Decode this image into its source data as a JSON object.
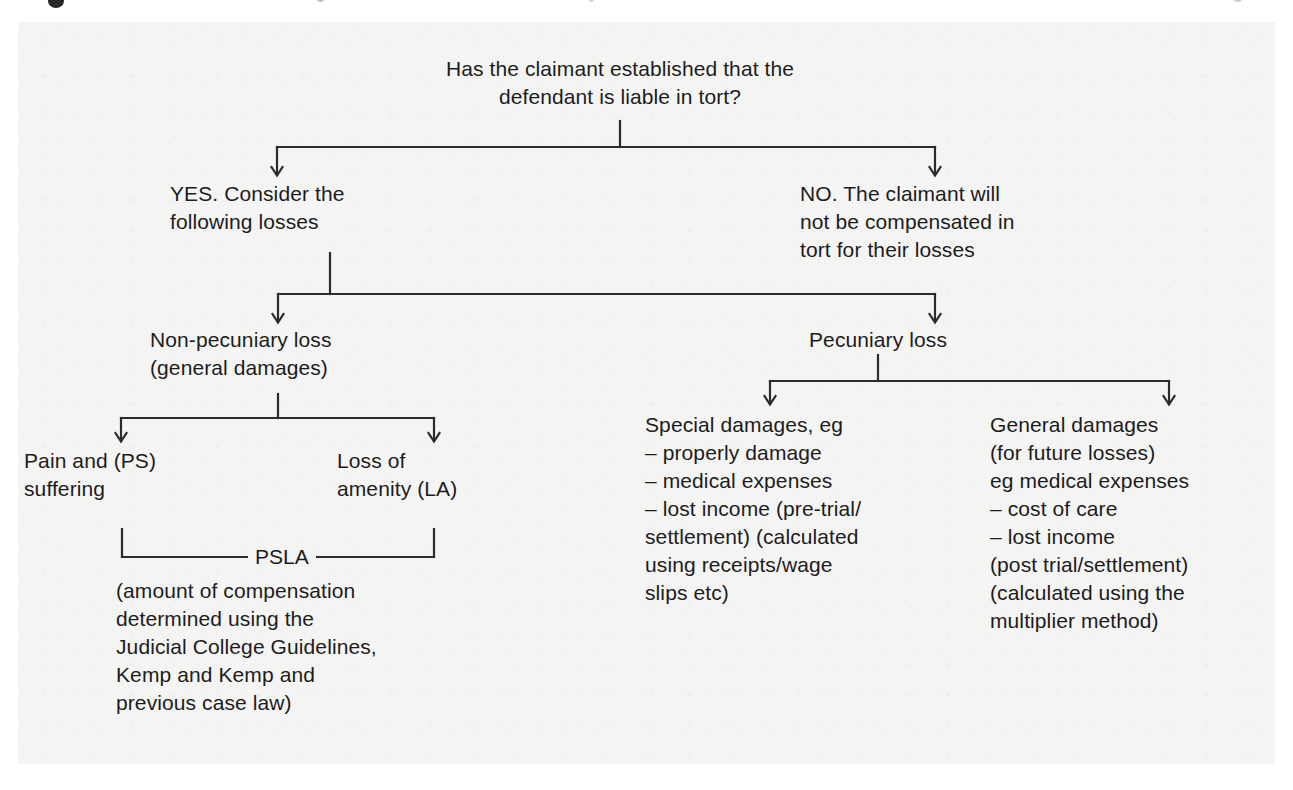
{
  "diagram": {
    "type": "flowchart",
    "title_visible": false,
    "background_color": "#f4f4f3",
    "line_color": "#2b2b2b",
    "text_color": "#1c1c1c",
    "nodes": {
      "root": {
        "id": "root",
        "label": "Has the claimant established that the\ndefendant is liable in tort?",
        "align": "center"
      },
      "yes": {
        "id": "yes",
        "label": "YES. Consider the\nfollowing losses",
        "align": "left"
      },
      "no": {
        "id": "no",
        "label": "NO. The claimant will\nnot be compensated in\ntort for their losses",
        "align": "left"
      },
      "non_pecuniary": {
        "id": "non-pecuniary-loss",
        "label": "Non-pecuniary loss\n(general damages)",
        "align": "left"
      },
      "pecuniary": {
        "id": "pecuniary-loss",
        "label": "Pecuniary loss",
        "align": "center"
      },
      "pain_suffering": {
        "id": "pain-and-suffering",
        "label": "Pain and (PS)\nsuffering",
        "align": "left"
      },
      "loss_amenity": {
        "id": "loss-of-amenity",
        "label": "Loss of\namenity (LA)",
        "align": "left"
      },
      "psla_label": {
        "id": "psla",
        "label": "PSLA"
      },
      "psla_note": {
        "id": "psla-note",
        "label": "(amount of compensation\ndetermined using the\nJudicial College Guidelines,\nKemp and Kemp and\nprevious case law)",
        "align": "left"
      },
      "special_damages": {
        "id": "special-damages",
        "label": "Special damages, eg\n–  properly damage\n–  medical expenses\n–  lost income (pre-trial/\n    settlement) (calculated\n    using receipts/wage\n    slips etc)",
        "align": "left"
      },
      "general_damages": {
        "id": "general-damages",
        "label": "General damages\n(for future losses)\neg medical expenses\n– cost of care\n– lost income\n(post trial/settlement)\n(calculated using the\nmultiplier method)",
        "align": "left"
      }
    },
    "edges": [
      {
        "from": "root",
        "to": "yes",
        "style": "elbow-split",
        "arrow": true
      },
      {
        "from": "root",
        "to": "no",
        "style": "elbow-split",
        "arrow": true
      },
      {
        "from": "yes",
        "to": "non_pecuniary",
        "style": "elbow-split",
        "arrow": true
      },
      {
        "from": "yes",
        "to": "pecuniary",
        "style": "elbow-split",
        "arrow": true
      },
      {
        "from": "non_pecuniary",
        "to": "pain_suffering",
        "style": "elbow-split",
        "arrow": true
      },
      {
        "from": "non_pecuniary",
        "to": "loss_amenity",
        "style": "elbow-split",
        "arrow": true
      },
      {
        "from": "pain_suffering",
        "to": "psla_label",
        "style": "up-bracket",
        "arrow": false
      },
      {
        "from": "loss_amenity",
        "to": "psla_label",
        "style": "up-bracket",
        "arrow": false
      },
      {
        "from": "pecuniary",
        "to": "special_damages",
        "style": "elbow-split",
        "arrow": true
      },
      {
        "from": "pecuniary",
        "to": "general_damages",
        "style": "elbow-split",
        "arrow": true
      }
    ]
  }
}
